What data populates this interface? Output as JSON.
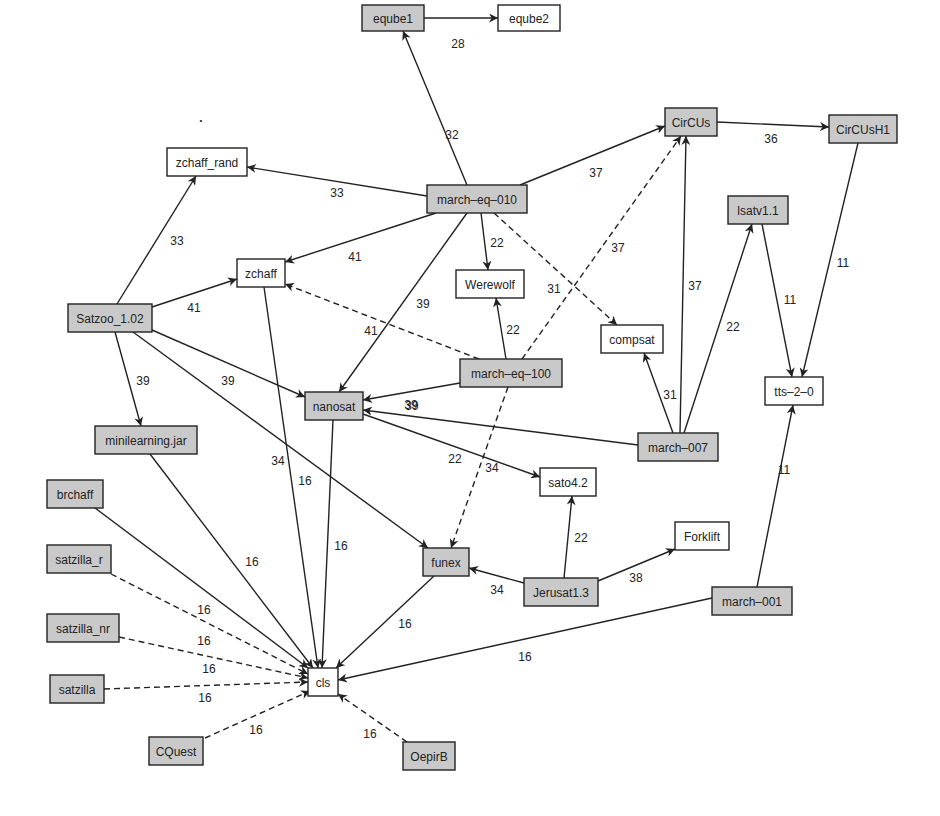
{
  "diagram": {
    "type": "directed-graph",
    "colors": {
      "shaded_fill": "#c9c9c9",
      "plain_fill": "#ffffff",
      "stroke": "#222222"
    },
    "nodes": [
      {
        "id": "eqube1",
        "label": "eqube1",
        "x": 362,
        "y": 5,
        "w": 62,
        "h": 26,
        "shaded": true
      },
      {
        "id": "eqube2",
        "label": "eqube2",
        "x": 498,
        "y": 5,
        "w": 62,
        "h": 26,
        "shaded": false
      },
      {
        "id": "CirCUs",
        "label": "CirCUs",
        "x": 665,
        "y": 108,
        "w": 52,
        "h": 28,
        "shaded": true
      },
      {
        "id": "CirCUsH1",
        "label": "CirCUsH1",
        "x": 829,
        "y": 115,
        "w": 68,
        "h": 28,
        "shaded": true
      },
      {
        "id": "zchaff_rand",
        "label": "zchaff_rand",
        "x": 167,
        "y": 148,
        "w": 80,
        "h": 28,
        "shaded": false
      },
      {
        "id": "march-eq-010",
        "label": "march–eq–010",
        "x": 427,
        "y": 185,
        "w": 100,
        "h": 28,
        "shaded": true
      },
      {
        "id": "lsatv1.1",
        "label": "lsatv1.1",
        "x": 728,
        "y": 196,
        "w": 60,
        "h": 28,
        "shaded": true
      },
      {
        "id": "zchaff",
        "label": "zchaff",
        "x": 237,
        "y": 259,
        "w": 48,
        "h": 28,
        "shaded": false
      },
      {
        "id": "Werewolf",
        "label": "Werewolf",
        "x": 456,
        "y": 270,
        "w": 68,
        "h": 28,
        "shaded": false
      },
      {
        "id": "Satzoo_1.02",
        "label": "Satzoo_1.02",
        "x": 68,
        "y": 304,
        "w": 84,
        "h": 28,
        "shaded": true
      },
      {
        "id": "compsat",
        "label": "compsat",
        "x": 601,
        "y": 325,
        "w": 62,
        "h": 28,
        "shaded": false
      },
      {
        "id": "march-eq-100",
        "label": "march–eq–100",
        "x": 460,
        "y": 359,
        "w": 102,
        "h": 28,
        "shaded": true
      },
      {
        "id": "tts-2-0",
        "label": "tts–2–0",
        "x": 765,
        "y": 377,
        "w": 58,
        "h": 28,
        "shaded": false
      },
      {
        "id": "nanosat",
        "label": "nanosat",
        "x": 305,
        "y": 392,
        "w": 58,
        "h": 28,
        "shaded": true
      },
      {
        "id": "minilearning.jar",
        "label": "minilearning.jar",
        "x": 95,
        "y": 426,
        "w": 102,
        "h": 28,
        "shaded": true
      },
      {
        "id": "march-007",
        "label": "march–007",
        "x": 638,
        "y": 433,
        "w": 80,
        "h": 28,
        "shaded": true
      },
      {
        "id": "sato4.2",
        "label": "sato4.2",
        "x": 540,
        "y": 468,
        "w": 56,
        "h": 28,
        "shaded": false
      },
      {
        "id": "brchaff",
        "label": "brchaff",
        "x": 47,
        "y": 480,
        "w": 56,
        "h": 28,
        "shaded": true
      },
      {
        "id": "Forklift",
        "label": "Forklift",
        "x": 675,
        "y": 522,
        "w": 54,
        "h": 28,
        "shaded": false
      },
      {
        "id": "funex",
        "label": "funex",
        "x": 423,
        "y": 548,
        "w": 46,
        "h": 28,
        "shaded": true
      },
      {
        "id": "satzilla_r",
        "label": "satzilla_r",
        "x": 47,
        "y": 545,
        "w": 64,
        "h": 28,
        "shaded": true
      },
      {
        "id": "Jerusat1.3",
        "label": "Jerusat1.3",
        "x": 524,
        "y": 578,
        "w": 74,
        "h": 28,
        "shaded": true
      },
      {
        "id": "march-001",
        "label": "march–001",
        "x": 712,
        "y": 587,
        "w": 80,
        "h": 28,
        "shaded": true
      },
      {
        "id": "satzilla_nr",
        "label": "satzilla_nr",
        "x": 47,
        "y": 614,
        "w": 72,
        "h": 28,
        "shaded": true
      },
      {
        "id": "cls",
        "label": "cls",
        "x": 308,
        "y": 668,
        "w": 30,
        "h": 28,
        "shaded": false
      },
      {
        "id": "satzilla",
        "label": "satzilla",
        "x": 50,
        "y": 675,
        "w": 54,
        "h": 28,
        "shaded": true
      },
      {
        "id": "CQuest",
        "label": "CQuest",
        "x": 149,
        "y": 737,
        "w": 54,
        "h": 28,
        "shaded": true
      },
      {
        "id": "OepirB",
        "label": "OepirB",
        "x": 403,
        "y": 742,
        "w": 52,
        "h": 28,
        "shaded": true
      }
    ],
    "edges": [
      {
        "from": "eqube1",
        "to": "eqube2",
        "label": "28",
        "dashed": false,
        "x1": 424,
        "y1": 18,
        "x2": 498,
        "y2": 18,
        "lx": 458,
        "ly": 44
      },
      {
        "from": "march-eq-010",
        "to": "eqube1",
        "label": "32",
        "dashed": false,
        "x1": 467,
        "y1": 185,
        "x2": 403,
        "y2": 31,
        "lx": 452,
        "ly": 135
      },
      {
        "from": "march-eq-010",
        "to": "CirCUs",
        "label": "37",
        "dashed": false,
        "x1": 520,
        "y1": 185,
        "x2": 665,
        "y2": 126,
        "lx": 596,
        "ly": 173
      },
      {
        "from": "CirCUs",
        "to": "CirCUsH1",
        "label": "36",
        "dashed": false,
        "x1": 717,
        "y1": 122,
        "x2": 829,
        "y2": 127,
        "lx": 771,
        "ly": 139
      },
      {
        "from": "march-eq-010",
        "to": "zchaff_rand",
        "label": "33",
        "dashed": false,
        "x1": 427,
        "y1": 196,
        "x2": 247,
        "y2": 167,
        "lx": 337,
        "ly": 193
      },
      {
        "from": "Satzoo_1.02",
        "to": "zchaff_rand",
        "label": "33",
        "dashed": false,
        "x1": 117,
        "y1": 304,
        "x2": 196,
        "y2": 176,
        "lx": 177,
        "ly": 241
      },
      {
        "from": "march-eq-010",
        "to": "zchaff",
        "label": "41",
        "dashed": false,
        "x1": 436,
        "y1": 213,
        "x2": 285,
        "y2": 262,
        "lx": 355,
        "ly": 257
      },
      {
        "from": "Satzoo_1.02",
        "to": "zchaff",
        "label": "41",
        "dashed": false,
        "x1": 152,
        "y1": 307,
        "x2": 237,
        "y2": 279,
        "lx": 194,
        "ly": 308
      },
      {
        "from": "march-eq-010",
        "to": "Werewolf",
        "label": "22",
        "dashed": false,
        "x1": 481,
        "y1": 213,
        "x2": 488,
        "y2": 270,
        "lx": 497,
        "ly": 243
      },
      {
        "from": "march-eq-010",
        "to": "compsat",
        "label": "31",
        "dashed": true,
        "x1": 494,
        "y1": 213,
        "x2": 617,
        "y2": 325,
        "lx": 554,
        "ly": 289
      },
      {
        "from": "march-eq-010",
        "to": "nanosat",
        "label": "39",
        "dashed": false,
        "x1": 467,
        "y1": 213,
        "x2": 339,
        "y2": 392,
        "lx": 423,
        "ly": 304
      },
      {
        "from": "march-eq-100",
        "to": "zchaff",
        "label": "41",
        "dashed": true,
        "x1": 479,
        "y1": 359,
        "x2": 285,
        "y2": 284,
        "lx": 371,
        "ly": 331
      },
      {
        "from": "march-eq-100",
        "to": "Werewolf",
        "label": "22",
        "dashed": false,
        "x1": 506,
        "y1": 359,
        "x2": 496,
        "y2": 298,
        "lx": 513,
        "ly": 330
      },
      {
        "from": "march-eq-100",
        "to": "CirCUs",
        "label": "37",
        "dashed": true,
        "x1": 522,
        "y1": 359,
        "x2": 681,
        "y2": 136,
        "lx": 618,
        "ly": 248
      },
      {
        "from": "march-eq-100",
        "to": "nanosat",
        "label": "39",
        "dashed": false,
        "x1": 460,
        "y1": 383,
        "x2": 363,
        "y2": 400,
        "lx": 411,
        "ly": 405
      },
      {
        "from": "march-eq-100",
        "to": "funex",
        "label": "34",
        "dashed": true,
        "x1": 508,
        "y1": 387,
        "x2": 451,
        "y2": 548,
        "lx": 492,
        "ly": 468
      },
      {
        "from": "march-007",
        "to": "CirCUs",
        "label": "37",
        "dashed": false,
        "x1": 680,
        "y1": 433,
        "x2": 686,
        "y2": 136,
        "lx": 695,
        "ly": 286
      },
      {
        "from": "march-007",
        "to": "lsatv1.1",
        "label": "22",
        "dashed": false,
        "x1": 684,
        "y1": 433,
        "x2": 752,
        "y2": 224,
        "lx": 733,
        "ly": 327
      },
      {
        "from": "march-007",
        "to": "compsat",
        "label": "31",
        "dashed": false,
        "x1": 673,
        "y1": 433,
        "x2": 644,
        "y2": 353,
        "lx": 670,
        "ly": 395
      },
      {
        "from": "march-007",
        "to": "nanosat",
        "label": "39",
        "dashed": false,
        "x1": 638,
        "y1": 445,
        "x2": 363,
        "y2": 410,
        "lx": 412,
        "ly": 406
      },
      {
        "from": "lsatv1.1",
        "to": "tts-2-0",
        "label": "11",
        "dashed": false,
        "x1": 762,
        "y1": 224,
        "x2": 792,
        "y2": 377,
        "lx": 790,
        "ly": 300
      },
      {
        "from": "CirCUsH1",
        "to": "tts-2-0",
        "label": "11",
        "dashed": false,
        "x1": 858,
        "y1": 143,
        "x2": 802,
        "y2": 377,
        "lx": 843,
        "ly": 263
      },
      {
        "from": "march-001",
        "to": "tts-2-0",
        "label": "11",
        "dashed": false,
        "x1": 757,
        "y1": 587,
        "x2": 793,
        "y2": 405,
        "lx": 784,
        "ly": 470
      },
      {
        "from": "Satzoo_1.02",
        "to": "nanosat",
        "label": "39",
        "dashed": false,
        "x1": 152,
        "y1": 330,
        "x2": 305,
        "y2": 397,
        "lx": 228,
        "ly": 381
      },
      {
        "from": "Satzoo_1.02",
        "to": "minilearning.jar",
        "label": "39",
        "dashed": false,
        "x1": 115,
        "y1": 332,
        "x2": 141,
        "y2": 426,
        "lx": 143,
        "ly": 381
      },
      {
        "from": "Satzoo_1.02",
        "to": "funex",
        "label": "34",
        "dashed": false,
        "x1": 133,
        "y1": 332,
        "x2": 428,
        "y2": 548,
        "lx": 278,
        "ly": 461
      },
      {
        "from": "nanosat",
        "to": "sato4.2",
        "label": "22",
        "dashed": false,
        "x1": 363,
        "y1": 414,
        "x2": 540,
        "y2": 477,
        "lx": 455,
        "ly": 459
      },
      {
        "from": "Jerusat1.3",
        "to": "sato4.2",
        "label": "22",
        "dashed": false,
        "x1": 564,
        "y1": 578,
        "x2": 572,
        "y2": 496,
        "lx": 581,
        "ly": 538
      },
      {
        "from": "Jerusat1.3",
        "to": "funex",
        "label": "34",
        "dashed": false,
        "x1": 524,
        "y1": 583,
        "x2": 469,
        "y2": 568,
        "lx": 497,
        "ly": 590
      },
      {
        "from": "Jerusat1.3",
        "to": "Forklift",
        "label": "38",
        "dashed": false,
        "x1": 598,
        "y1": 581,
        "x2": 675,
        "y2": 549,
        "lx": 636,
        "ly": 578
      },
      {
        "from": "zchaff",
        "to": "cls",
        "label": "16",
        "dashed": false,
        "x1": 264,
        "y1": 287,
        "x2": 318,
        "y2": 668,
        "lx": 305,
        "ly": 481
      },
      {
        "from": "nanosat",
        "to": "cls",
        "label": "16",
        "dashed": false,
        "x1": 333,
        "y1": 420,
        "x2": 322,
        "y2": 668,
        "lx": 341,
        "ly": 546
      },
      {
        "from": "minilearning.jar",
        "to": "cls",
        "label": "16",
        "dashed": false,
        "x1": 150,
        "y1": 454,
        "x2": 313,
        "y2": 668,
        "lx": 252,
        "ly": 562
      },
      {
        "from": "funex",
        "to": "cls",
        "label": "16",
        "dashed": false,
        "x1": 434,
        "y1": 576,
        "x2": 336,
        "y2": 668,
        "lx": 405,
        "ly": 624
      },
      {
        "from": "brchaff",
        "to": "cls",
        "label": "16",
        "dashed": false,
        "x1": 95,
        "y1": 508,
        "x2": 308,
        "y2": 668,
        "lx": 204,
        "ly": 610
      },
      {
        "from": "satzilla_r",
        "to": "cls",
        "label": "16",
        "dashed": true,
        "x1": 111,
        "y1": 574,
        "x2": 308,
        "y2": 674,
        "lx": 204,
        "ly": 641
      },
      {
        "from": "satzilla_nr",
        "to": "cls",
        "label": "16",
        "dashed": true,
        "x1": 119,
        "y1": 637,
        "x2": 308,
        "y2": 678,
        "lx": 209,
        "ly": 669
      },
      {
        "from": "satzilla",
        "to": "cls",
        "label": "16",
        "dashed": true,
        "x1": 104,
        "y1": 689,
        "x2": 308,
        "y2": 682,
        "lx": 205,
        "ly": 698
      },
      {
        "from": "CQuest",
        "to": "cls",
        "label": "16",
        "dashed": true,
        "x1": 205,
        "y1": 738,
        "x2": 310,
        "y2": 691,
        "lx": 256,
        "ly": 730
      },
      {
        "from": "OepirB",
        "to": "cls",
        "label": "16",
        "dashed": true,
        "x1": 407,
        "y1": 742,
        "x2": 338,
        "y2": 694,
        "lx": 370,
        "ly": 734
      },
      {
        "from": "march-001",
        "to": "cls",
        "label": "16",
        "dashed": false,
        "x1": 712,
        "y1": 598,
        "x2": 338,
        "y2": 680,
        "lx": 525,
        "ly": 657
      }
    ]
  },
  "annotations": {
    "stray_mark": "•"
  }
}
